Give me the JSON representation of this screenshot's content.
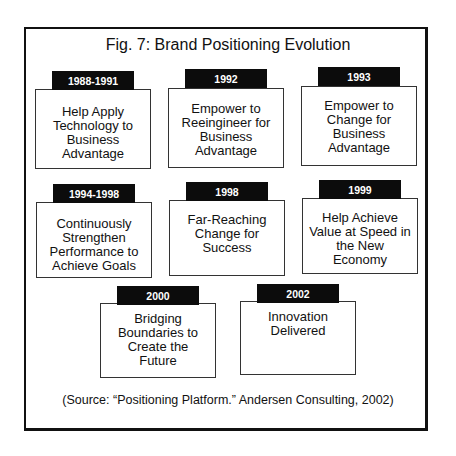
{
  "title": "Fig. 7: Brand Positioning Evolution",
  "items": [
    {
      "period": "1988-1991",
      "text": "Help Apply Technology to Business Advantage"
    },
    {
      "period": "1992",
      "text": "Empower to Reeingineer for Business Advantage"
    },
    {
      "period": "1993",
      "text": "Empower to Change for Business Advantage"
    },
    {
      "period": "1994-1998",
      "text": "Continuously Strengthen Performance to Achieve Goals"
    },
    {
      "period": "1998",
      "text": "Far-Reaching Change for Success"
    },
    {
      "period": "1999",
      "text": "Help Achieve Value at Speed in the New Economy"
    },
    {
      "period": "2000",
      "text": "Bridging Boundaries to Create the Future"
    },
    {
      "period": "2002",
      "text": "Innovation Delivered"
    }
  ],
  "source": "(Source: “Positioning Platform.” Andersen Consulting, 2002)"
}
